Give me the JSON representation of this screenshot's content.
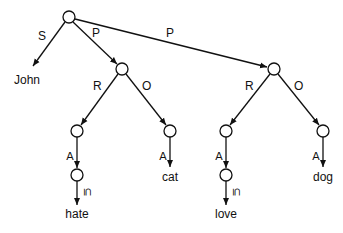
{
  "nodes": [
    {
      "id": "root",
      "x": 69,
      "y": 17
    },
    {
      "id": "p1",
      "x": 122,
      "y": 69
    },
    {
      "id": "p2",
      "x": 274,
      "y": 69
    },
    {
      "id": "r1",
      "x": 77,
      "y": 131
    },
    {
      "id": "r1b",
      "x": 77,
      "y": 175
    },
    {
      "id": "o1",
      "x": 170,
      "y": 131
    },
    {
      "id": "r2",
      "x": 226,
      "y": 131
    },
    {
      "id": "r2b",
      "x": 226,
      "y": 175
    },
    {
      "id": "o2",
      "x": 323,
      "y": 131
    }
  ],
  "terminals": {
    "john": "John",
    "hate": "hate",
    "cat": "cat",
    "love": "love",
    "dog": "dog"
  },
  "edge_labels": {
    "s": "S",
    "p1": "P",
    "p2": "P",
    "r1": "R",
    "o1": "O",
    "r2": "R",
    "o2": "O",
    "forall": "∀",
    "subseteq": "⊆"
  }
}
